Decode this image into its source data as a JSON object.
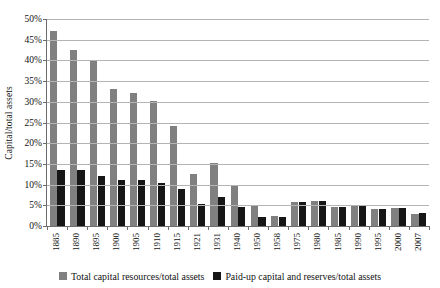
{
  "chart_data": {
    "type": "bar",
    "title": "",
    "xlabel": "",
    "ylabel": "Capital/total assets",
    "ylim": [
      0,
      50
    ],
    "ytick_step": 5,
    "ytick_labels": [
      "0%",
      "5%",
      "10%",
      "15%",
      "20%",
      "25%",
      "30%",
      "35%",
      "40%",
      "45%",
      "50%"
    ],
    "grid": true,
    "legend_position": "bottom",
    "categories": [
      "1885",
      "1890",
      "1895",
      "1900",
      "1905",
      "1910",
      "1915",
      "1921",
      "1931",
      "1940",
      "1950",
      "1958",
      "1975",
      "1980",
      "1985",
      "1990",
      "1995",
      "2000",
      "2007"
    ],
    "series": [
      {
        "name": "Total capital resources/total assets",
        "color": "#808080",
        "values": [
          47.0,
          42.5,
          40.0,
          33.0,
          32.1,
          30.2,
          24.2,
          12.5,
          15.2,
          10.0,
          4.8,
          2.3,
          5.8,
          6.1,
          4.6,
          5.0,
          4.2,
          4.4,
          3.0
        ]
      },
      {
        "name": "Paid-up capital and reserves/total assets",
        "color": "#161616",
        "values": [
          13.6,
          13.6,
          12.0,
          11.1,
          11.1,
          10.4,
          9.0,
          5.3,
          7.0,
          4.5,
          2.2,
          2.2,
          5.9,
          6.1,
          4.7,
          5.0,
          4.2,
          4.4,
          3.1
        ]
      }
    ]
  }
}
